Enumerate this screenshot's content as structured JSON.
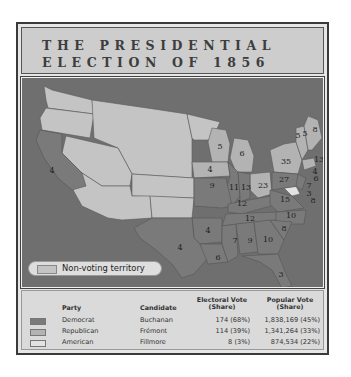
{
  "title": {
    "line1": "THE PRESIDENTIAL",
    "line2": "ELECTION OF 1856"
  },
  "colors": {
    "democrat": "#7a7a7a",
    "republican": "#b3b3b3",
    "american": "#e2e2e2",
    "non_voting": "#c4c4c4",
    "water": "#6f6f6f"
  },
  "map": {
    "legend_label": "Non-voting territory",
    "state_labels": [
      {
        "state": "California",
        "ev": "4"
      },
      {
        "state": "Texas",
        "ev": "4"
      },
      {
        "state": "Iowa",
        "ev": "4"
      },
      {
        "state": "Wisconsin",
        "ev": "5"
      },
      {
        "state": "Michigan",
        "ev": "6"
      },
      {
        "state": "Illinois",
        "ev": "11"
      },
      {
        "state": "Indiana",
        "ev": "13"
      },
      {
        "state": "Ohio",
        "ev": "23"
      },
      {
        "state": "Pennsylvania",
        "ev": "27"
      },
      {
        "state": "New York",
        "ev": "35"
      },
      {
        "state": "Vermont",
        "ev": "5"
      },
      {
        "state": "New Hampshire",
        "ev": "5"
      },
      {
        "state": "Maine",
        "ev": "8"
      },
      {
        "state": "Massachusetts",
        "ev": "13"
      },
      {
        "state": "Rhode Island",
        "ev": "4"
      },
      {
        "state": "Connecticut",
        "ev": "6"
      },
      {
        "state": "New Jersey",
        "ev": "7"
      },
      {
        "state": "Delaware",
        "ev": "3"
      },
      {
        "state": "Maryland",
        "ev": "8"
      },
      {
        "state": "Missouri",
        "ev": "9"
      },
      {
        "state": "Kentucky",
        "ev": "12"
      },
      {
        "state": "Virginia",
        "ev": "15"
      },
      {
        "state": "Tennessee",
        "ev": "12"
      },
      {
        "state": "North Carolina",
        "ev": "10"
      },
      {
        "state": "Arkansas",
        "ev": "4"
      },
      {
        "state": "South Carolina",
        "ev": "8"
      },
      {
        "state": "Mississippi",
        "ev": "7"
      },
      {
        "state": "Alabama",
        "ev": "9"
      },
      {
        "state": "Georgia",
        "ev": "10"
      },
      {
        "state": "Louisiana",
        "ev": "6"
      },
      {
        "state": "Florida",
        "ev": "3"
      }
    ]
  },
  "table": {
    "headers": {
      "party": "Party",
      "candidate": "Candidate",
      "electoral_1": "Electoral Vote",
      "electoral_2": "(Share)",
      "popular_1": "Popular Vote",
      "popular_2": "(Share)"
    },
    "rows": [
      {
        "party": "Democrat",
        "candidate": "Buchanan",
        "electoral": "174 (68%)",
        "popular": "1,838,169 (45%)"
      },
      {
        "party": "Republican",
        "candidate": "Frémont",
        "electoral": "114 (39%)",
        "popular": "1,341,264 (33%)"
      },
      {
        "party": "American",
        "candidate": "Fillmore",
        "electoral": "8 (3%)",
        "popular": "874,534 (22%)"
      }
    ]
  }
}
